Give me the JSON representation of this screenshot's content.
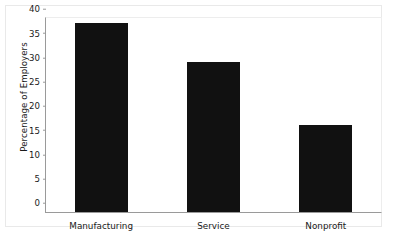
{
  "chart_data": {
    "type": "bar",
    "title": "",
    "xlabel": "",
    "ylabel": "Percentage of Employers",
    "categories": [
      "Manufacturing",
      "Service",
      "Nonprofit"
    ],
    "values": [
      39,
      31,
      18
    ],
    "ylim": [
      0,
      40
    ],
    "ytick_step": 5,
    "ytick_labels": [
      "0",
      "5",
      "10",
      "15",
      "20",
      "25",
      "30",
      "35",
      "40"
    ],
    "grid": false,
    "legend": null,
    "bar_color": "#111111",
    "axis_color": "#9a9a9a",
    "frame_color": "#e9e9e9",
    "background_color": "#ffffff"
  }
}
